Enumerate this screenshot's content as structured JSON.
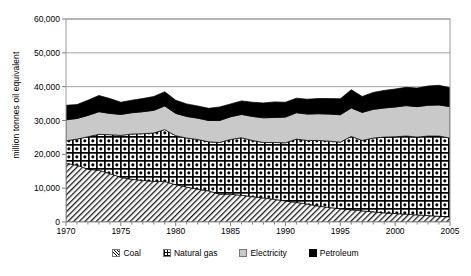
{
  "chart_data": {
    "type": "area",
    "stacked": true,
    "title": "",
    "subtitle": "",
    "xlabel": "",
    "ylabel": "million tonnes oil equivalent",
    "xlim": [
      1970,
      2005
    ],
    "ylim": [
      0,
      60000
    ],
    "ytick_labels": [
      "0",
      "10,000",
      "20,000",
      "30,000",
      "40,000",
      "50,000",
      "60,000"
    ],
    "ytick_values": [
      0,
      10000,
      20000,
      30000,
      40000,
      50000,
      60000
    ],
    "xtick_labels": [
      "1970",
      "1975",
      "1980",
      "1985",
      "1990",
      "1995",
      "2000",
      "2005"
    ],
    "xtick_values": [
      1970,
      1975,
      1980,
      1985,
      1990,
      1995,
      2000,
      2005
    ],
    "grid": "horizontal",
    "legend_position": "bottom",
    "x": [
      1970,
      1971,
      1972,
      1973,
      1974,
      1975,
      1976,
      1977,
      1978,
      1979,
      1980,
      1981,
      1982,
      1983,
      1984,
      1985,
      1986,
      1987,
      1988,
      1989,
      1990,
      1991,
      1992,
      1993,
      1994,
      1995,
      1996,
      1997,
      1998,
      1999,
      2000,
      2001,
      2002,
      2003,
      2004,
      2005
    ],
    "series": [
      {
        "name": "Coal",
        "fill": "diagonal-hatch",
        "values": [
          17300,
          16800,
          15600,
          15300,
          14300,
          13200,
          12600,
          12300,
          12000,
          12000,
          11000,
          10300,
          9700,
          9200,
          8200,
          8200,
          7900,
          7500,
          7100,
          6700,
          6200,
          5800,
          5300,
          4700,
          4300,
          3900,
          3600,
          3300,
          3000,
          2700,
          2500,
          2300,
          2100,
          1900,
          1700,
          1500
        ]
      },
      {
        "name": "Natural gas",
        "fill": "cross-dot-hatch",
        "values": [
          6700,
          7700,
          9600,
          10600,
          11500,
          12400,
          13400,
          13800,
          14300,
          15300,
          14500,
          14500,
          14700,
          14500,
          15300,
          16200,
          17000,
          16600,
          16400,
          16800,
          17200,
          18700,
          18800,
          19400,
          19600,
          19700,
          21700,
          20800,
          21800,
          22400,
          22700,
          23100,
          23000,
          23500,
          23700,
          23300
        ]
      },
      {
        "name": "Electricity",
        "fill": "solid-light-gray",
        "values": [
          6200,
          6100,
          6300,
          6700,
          6300,
          6200,
          6300,
          6500,
          6700,
          7000,
          6600,
          6400,
          6300,
          6300,
          6500,
          6700,
          6900,
          7100,
          7300,
          7400,
          7600,
          7800,
          7800,
          7900,
          8000,
          8100,
          8400,
          8300,
          8500,
          8600,
          8800,
          9000,
          9000,
          9100,
          9200,
          9300
        ]
      },
      {
        "name": "Petroleum",
        "fill": "solid-black",
        "values": [
          4300,
          4100,
          4500,
          4800,
          4400,
          3600,
          3700,
          3900,
          4100,
          4200,
          3900,
          3700,
          3600,
          3600,
          4000,
          3800,
          4000,
          4200,
          4400,
          4600,
          4400,
          4300,
          4400,
          4500,
          4600,
          4700,
          5400,
          4700,
          5000,
          5200,
          5300,
          5400,
          5500,
          5700,
          5800,
          5600
        ]
      }
    ],
    "totals": [
      34500,
      34700,
      36000,
      37400,
      36500,
      35400,
      36000,
      36500,
      37100,
      38500,
      36000,
      34900,
      34300,
      33600,
      34000,
      34900,
      35800,
      35400,
      35200,
      35500,
      35400,
      36600,
      36300,
      36500,
      36500,
      36400,
      39100,
      37100,
      38300,
      38900,
      39300,
      39800,
      39600,
      40200,
      40400,
      39700
    ]
  },
  "legend": {
    "items": [
      {
        "label": "Coal",
        "swatch": "coal-swatch-icon"
      },
      {
        "label": "Natural gas",
        "swatch": "natural-gas-swatch-icon"
      },
      {
        "label": "Electricity",
        "swatch": "electricity-swatch-icon"
      },
      {
        "label": "Petroleum",
        "swatch": "petroleum-swatch-icon"
      }
    ]
  },
  "colors": {
    "coal": "#ffffff",
    "natural_gas": "#ffffff",
    "electricity": "#c9c9c9",
    "petroleum": "#000000",
    "gridline": "#a6a6a6",
    "axis": "#808080",
    "text": "#000000"
  }
}
